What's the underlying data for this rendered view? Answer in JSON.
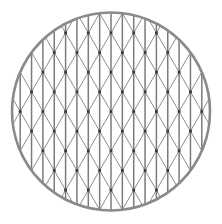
{
  "figure": {
    "type": "geometric-diagram",
    "background_color": "#ffffff",
    "canvas": {
      "width": 222,
      "height": 224
    }
  },
  "chart_data": {
    "type": "diagram",
    "subtitle": "",
    "xlabel": "",
    "ylabel": "",
    "grid": true,
    "legend": false,
    "geometry": {
      "circle": {
        "center_x": 111,
        "center_y": 111.5,
        "radius": 99,
        "stroke_color": "#8a8a8a",
        "stroke_width": 2.6
      },
      "lattice": {
        "column_spacing": 22.7,
        "row_spacing": 19.66,
        "column_count": 11,
        "row_count": 13,
        "origin_x": 111,
        "origin_y": 111.5,
        "diagonal_angle_degrees": 60,
        "line_color": "#8d8d8d",
        "vertical_line_color": "#7b7b7b",
        "vertical_line_width": 1.5,
        "diagonal_line_width": 1.0
      },
      "nodes": {
        "color": "#3a3a3a",
        "radius": 1.4,
        "shape": "square"
      }
    }
  }
}
